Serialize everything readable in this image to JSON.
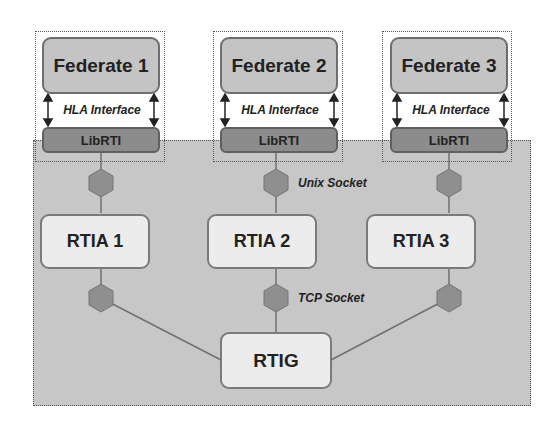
{
  "federates": [
    {
      "label": "Federate 1",
      "interface": "HLA Interface",
      "lib": "LibRTI",
      "rtia": "RTIA 1"
    },
    {
      "label": "Federate 2",
      "interface": "HLA Interface",
      "lib": "LibRTI",
      "rtia": "RTIA 2"
    },
    {
      "label": "Federate 3",
      "interface": "HLA Interface",
      "lib": "LibRTI",
      "rtia": "RTIA 3"
    }
  ],
  "gateway": {
    "label": "RTIG"
  },
  "connections": {
    "unix_label": "Unix Socket",
    "tcp_label": "TCP Socket"
  },
  "colors": {
    "container": "#c7c7c7",
    "federate": "#c4c4c4",
    "librti": "#8c8c8c",
    "node": "#ececec",
    "hexagon": "#8f8f8f"
  }
}
